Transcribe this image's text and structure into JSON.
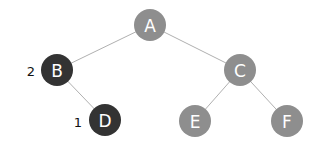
{
  "diagram": {
    "type": "binary-tree",
    "colors": {
      "default_node": "#8e8e8e",
      "highlighted_node": "#333333",
      "edge": "#b0b0b0",
      "node_text": "#ffffff",
      "annotation_text": "#111111"
    },
    "nodes": [
      {
        "id": "A",
        "label": "A",
        "x": 150,
        "y": 25,
        "r": 16,
        "highlighted": false
      },
      {
        "id": "B",
        "label": "B",
        "x": 57,
        "y": 70,
        "r": 16,
        "highlighted": true,
        "annotation": "2"
      },
      {
        "id": "C",
        "label": "C",
        "x": 240,
        "y": 70,
        "r": 16,
        "highlighted": false
      },
      {
        "id": "D",
        "label": "D",
        "x": 105,
        "y": 120,
        "r": 16,
        "highlighted": true,
        "annotation": "1"
      },
      {
        "id": "E",
        "label": "E",
        "x": 195,
        "y": 121,
        "r": 16,
        "highlighted": false
      },
      {
        "id": "F",
        "label": "F",
        "x": 287,
        "y": 121,
        "r": 16,
        "highlighted": false
      }
    ],
    "edges": [
      {
        "from": "A",
        "to": "B"
      },
      {
        "from": "A",
        "to": "C"
      },
      {
        "from": "B",
        "to": "D"
      },
      {
        "from": "C",
        "to": "E"
      },
      {
        "from": "C",
        "to": "F"
      }
    ],
    "annotations": {
      "B": "2",
      "D": "1"
    }
  }
}
